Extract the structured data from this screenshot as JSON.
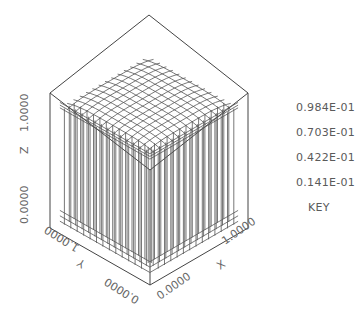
{
  "plot": {
    "type": "3d-isosurface-wireframe",
    "axes": {
      "x": {
        "label": "X",
        "min_label": "0.0000",
        "max_label": "1.0000"
      },
      "y": {
        "label": "Y",
        "min_label": "0.0000",
        "max_label": "1.0000"
      },
      "z": {
        "label": "Z",
        "min_label": "0.0000",
        "max_label": "1.0000"
      }
    },
    "colors": {
      "line": "#555555",
      "background": "#ffffff"
    }
  },
  "key": {
    "values": [
      "0.984E-01",
      "0.703E-01",
      "0.422E-01",
      "0.141E-01"
    ],
    "title": "KEY"
  }
}
